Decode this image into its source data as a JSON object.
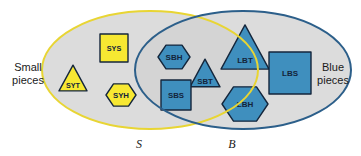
{
  "figure": {
    "type": "venn-diagram",
    "background_color": "#ffffff",
    "region_fill": "#dcdcdc"
  },
  "sets": {
    "left": {
      "letter": "S",
      "caption_line1": "Small",
      "caption_line2": "pieces",
      "outline_color": "#e8d534",
      "cx": 150,
      "cy": 70,
      "rx": 108,
      "ry": 59
    },
    "right": {
      "letter": "B",
      "caption_line1": "Blue",
      "caption_line2": "pieces",
      "outline_color": "#2c5f8a",
      "cx": 243,
      "cy": 70,
      "rx": 108,
      "ry": 59
    }
  },
  "colors": {
    "yellow_fill": "#f7e832",
    "blue_fill": "#3f8fbe",
    "shape_stroke": "#14263c",
    "text_dark": "#13243a"
  },
  "pieces": [
    {
      "id": "SYT",
      "label": "SYT",
      "shape": "triangle",
      "color": "yellow",
      "region": "S-only",
      "cx": 73,
      "cy": 78,
      "size": 28
    },
    {
      "id": "SYS",
      "label": "SYS",
      "shape": "square",
      "color": "yellow",
      "region": "S-only",
      "cx": 114,
      "cy": 48,
      "size": 28
    },
    {
      "id": "SYH",
      "label": "SYH",
      "shape": "hexagon",
      "color": "yellow",
      "region": "S-only",
      "cx": 121,
      "cy": 95,
      "size": 30
    },
    {
      "id": "SBH",
      "label": "SBH",
      "shape": "hexagon",
      "color": "blue",
      "region": "intersection",
      "cx": 174,
      "cy": 57,
      "size": 32
    },
    {
      "id": "SBT",
      "label": "SBT",
      "shape": "triangle",
      "color": "blue",
      "region": "intersection",
      "cx": 205,
      "cy": 73,
      "size": 30
    },
    {
      "id": "SBS",
      "label": "SBS",
      "shape": "square",
      "color": "blue",
      "region": "intersection",
      "cx": 176,
      "cy": 95,
      "size": 30
    },
    {
      "id": "LBT",
      "label": "LBT",
      "shape": "triangle",
      "color": "blue",
      "region": "B-only",
      "cx": 245,
      "cy": 47,
      "size": 48
    },
    {
      "id": "LBS",
      "label": "LBS",
      "shape": "square",
      "color": "blue",
      "region": "B-only",
      "cx": 290,
      "cy": 73,
      "size": 42
    },
    {
      "id": "LBH",
      "label": "LBH",
      "shape": "hexagon",
      "color": "blue",
      "region": "B-only",
      "cx": 245,
      "cy": 104,
      "size": 46
    }
  ],
  "set_letter_positions": {
    "S": {
      "x": 139,
      "y": 148
    },
    "B": {
      "x": 232,
      "y": 148
    }
  }
}
